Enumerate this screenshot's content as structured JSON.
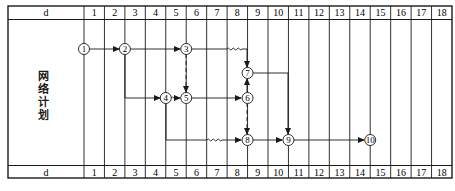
{
  "table": {
    "header_label": "d",
    "footer_label": "d",
    "days": [
      "1",
      "2",
      "3",
      "4",
      "5",
      "6",
      "7",
      "8",
      "9",
      "10",
      "11",
      "12",
      "13",
      "14",
      "15",
      "16",
      "17",
      "18"
    ],
    "side_label_chars": [
      "网",
      "络",
      "计",
      "划"
    ]
  },
  "network": {
    "nodes": [
      {
        "id": "1",
        "label": "1",
        "day_boundary": 0,
        "row": "r1"
      },
      {
        "id": "2",
        "label": "2",
        "day_boundary": 2,
        "row": "r1"
      },
      {
        "id": "3",
        "label": "3",
        "day_boundary": 5,
        "row": "r1"
      },
      {
        "id": "4",
        "label": "4",
        "day_boundary": 4,
        "row": "r3"
      },
      {
        "id": "5",
        "label": "5",
        "day_boundary": 5,
        "row": "r3"
      },
      {
        "id": "6",
        "label": "6",
        "day_boundary": 8,
        "row": "r3"
      },
      {
        "id": "7",
        "label": "7",
        "day_boundary": 8,
        "row": "r2"
      },
      {
        "id": "8",
        "label": "8",
        "day_boundary": 8,
        "row": "r4"
      },
      {
        "id": "9",
        "label": "9",
        "day_boundary": 10,
        "row": "r4"
      },
      {
        "id": "10",
        "label": "10",
        "day_boundary": 14,
        "row": "r4"
      }
    ],
    "arrows": [
      {
        "from": "1",
        "to": "2",
        "type": "real"
      },
      {
        "from": "2",
        "to": "3",
        "type": "real"
      },
      {
        "from": "2",
        "to": "4",
        "type": "real"
      },
      {
        "from": "3",
        "to": "7",
        "type": "real-with-free-float"
      },
      {
        "from": "3",
        "to": "5",
        "type": "dummy"
      },
      {
        "from": "4",
        "to": "5",
        "type": "free-float"
      },
      {
        "from": "4",
        "to": "8",
        "type": "real-with-free-float"
      },
      {
        "from": "5",
        "to": "6",
        "type": "real"
      },
      {
        "from": "6",
        "to": "7",
        "type": "real"
      },
      {
        "from": "6",
        "to": "8",
        "type": "dummy"
      },
      {
        "from": "7",
        "to": "9",
        "type": "real"
      },
      {
        "from": "8",
        "to": "9",
        "type": "real"
      },
      {
        "from": "9",
        "to": "10",
        "type": "real"
      }
    ]
  },
  "colors": {
    "line": "#1a1a1a",
    "background": "#ffffff"
  }
}
